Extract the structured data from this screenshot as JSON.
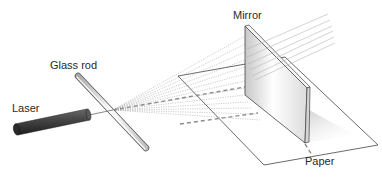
{
  "diagram": {
    "labels": {
      "laser": "Laser",
      "glass_rod": "Glass rod",
      "mirror": "Mirror",
      "paper": "Paper"
    },
    "components": [
      {
        "id": "laser",
        "label": "Laser",
        "shape": "dark cylinder"
      },
      {
        "id": "glass_rod",
        "label": "Glass rod",
        "shape": "transparent rod"
      },
      {
        "id": "paper",
        "label": "Paper",
        "shape": "flat sheet (parallelogram)"
      },
      {
        "id": "mirror",
        "label": "Mirror",
        "shape": "vertical plate standing on paper"
      }
    ],
    "light": {
      "fan_lines": 13,
      "center_beam": "dashed",
      "reflected_lines": 6
    },
    "colors": {
      "background": "#ffffff",
      "laser_body": "#3a3a3a",
      "rod": "#e8e8e8",
      "lines": "#555555",
      "fan": "#9a9a9a",
      "dashed_beam": "#8c8c8c"
    }
  }
}
